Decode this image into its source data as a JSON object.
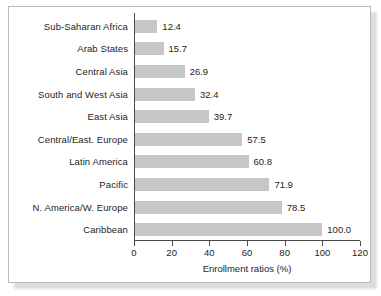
{
  "chart_data": {
    "type": "bar",
    "orientation": "horizontal",
    "title": "",
    "xlabel": "Enrollment ratios (%)",
    "ylabel": "",
    "xlim": [
      0,
      120
    ],
    "xticks": [
      0,
      20,
      40,
      60,
      80,
      100,
      120
    ],
    "xtick_labels": [
      "0",
      "20",
      "40",
      "60",
      "80",
      "100",
      "120"
    ],
    "grid": false,
    "legend": false,
    "bar_color": "#c6c6c6",
    "axis_color": "#4a4a4a",
    "text_color": "#1d1d1d",
    "categories": [
      "Sub-Saharan Africa",
      "Arab States",
      "Central Asia",
      "South and West Asia",
      "East Asia",
      "Central/East. Europe",
      "Latin America",
      "Pacific",
      "N. America/W. Europe",
      "Caribbean"
    ],
    "values": [
      12.4,
      15.7,
      26.9,
      32.4,
      39.7,
      57.5,
      60.8,
      71.9,
      78.5,
      100.0
    ],
    "value_labels": [
      "12.4",
      "15.7",
      "26.9",
      "32.4",
      "39.7",
      "57.5",
      "60.8",
      "71.9",
      "78.5",
      "100.0"
    ]
  }
}
